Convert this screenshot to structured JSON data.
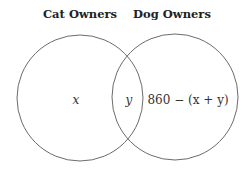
{
  "diagram": {
    "type": "venn",
    "sets": [
      {
        "label": "Cat Owners"
      },
      {
        "label": "Dog Owners"
      }
    ],
    "regions": {
      "cat_only": "x",
      "both": "y",
      "dog_only": "860 − (x + y)"
    },
    "colors": {
      "stroke": "#6b6b6b",
      "text": "#333333"
    }
  }
}
